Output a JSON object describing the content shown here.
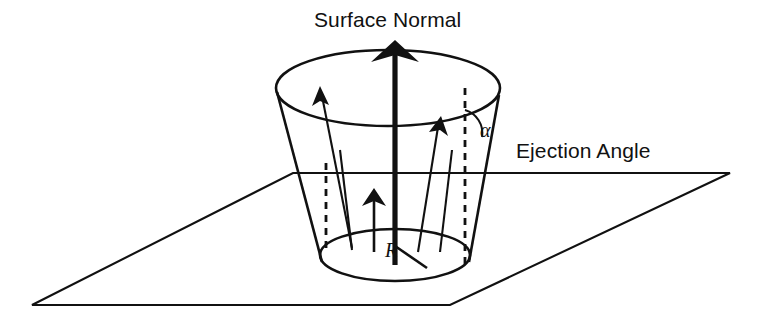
{
  "figure": {
    "background_color": "#ffffff",
    "ink_color": "#111111"
  },
  "labels": {
    "surface_normal": "Surface Normal",
    "ejection_angle": "Ejection Angle",
    "alpha_symbol": "α",
    "radius_symbol": "R"
  },
  "geometry": {
    "canvas": {
      "width": 763,
      "height": 324
    },
    "surface_plane": {
      "type": "parallelogram",
      "points": "293,173 730,173 450,305 32,305"
    },
    "cone": {
      "top_ellipse": {
        "cx": 388,
        "cy": 88,
        "rx": 112,
        "ry": 38
      },
      "bottom_ellipse": {
        "cx": 395,
        "cy": 255,
        "rx": 75,
        "ry": 26
      },
      "left_edge": "277,92 322,262",
      "right_edge": "499,95 469,262"
    },
    "surface_normal_arrow": {
      "x": 395,
      "y_tip": 42,
      "y_base": 265,
      "head_width": 44,
      "head_height": 22
    },
    "dashed_verticals": [
      {
        "x": 326,
        "y1": 163,
        "y2": 250
      },
      {
        "x": 465,
        "y1": 88,
        "y2": 264
      }
    ],
    "ejection_arrows": [
      {
        "x1": 352,
        "y1": 248,
        "x2": 320,
        "y2": 90
      },
      {
        "x1": 378,
        "y1": 250,
        "x2": 372,
        "y2": 190
      },
      {
        "x1": 418,
        "y1": 252,
        "x2": 441,
        "y2": 118
      }
    ],
    "radius_line": "395,246 427,268",
    "angle_arc": {
      "cx": 465,
      "cy": 128,
      "r": 22
    }
  }
}
